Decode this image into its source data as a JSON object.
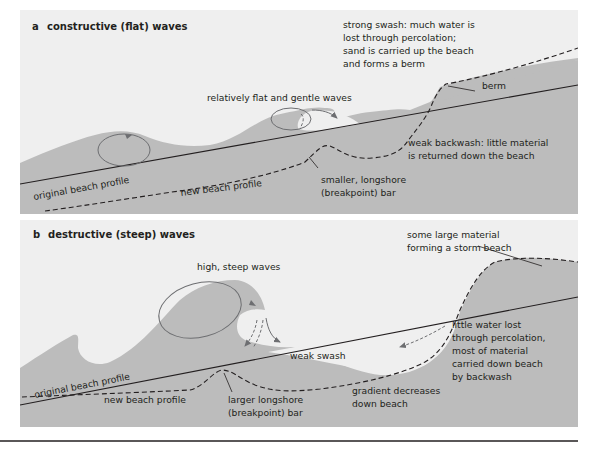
{
  "colors": {
    "panel_bg": "#efefef",
    "sea": "#bcbcbc",
    "line": "#231f20",
    "orbit": "#6d6e71"
  },
  "panel_a": {
    "letter": "a",
    "title": "constructive (flat) waves",
    "labels": {
      "swash": [
        "strong swash: much water is",
        "lost through percolation;",
        "sand is carried up the beach",
        "and forms a berm"
      ],
      "berm": "berm",
      "waves": "relatively flat and gentle waves",
      "backwash": [
        "weak backwash: little material",
        "is returned down the beach"
      ],
      "bar": [
        "smaller, longshore",
        "(breakpoint) bar"
      ],
      "original_profile": "original beach profile",
      "new_profile": "new beach profile"
    }
  },
  "panel_b": {
    "letter": "b",
    "title": "destructive (steep) waves",
    "labels": {
      "storm_beach": [
        "some large material",
        "forming a storm beach"
      ],
      "waves": "high, steep waves",
      "swash": "weak swash",
      "percolation": [
        "little water lost",
        "through percolation,",
        "most of material",
        "carried down beach",
        "by backwash"
      ],
      "bar": [
        "larger longshore",
        "(breakpoint) bar"
      ],
      "gradient": [
        "gradient decreases",
        "down beach"
      ],
      "original_profile": "original beach profile",
      "new_profile": "new beach profile"
    }
  }
}
